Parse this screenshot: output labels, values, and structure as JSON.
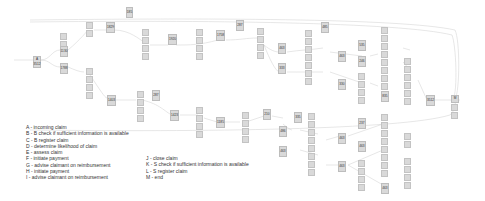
{
  "diagram": {
    "type": "process-graph",
    "start_node": {
      "label": "A",
      "count": "3512"
    },
    "end_node": {
      "label": "M",
      "count": "3512"
    },
    "nodes": [
      {
        "id": "n1",
        "label": "?",
        "count": "1130",
        "x": 60,
        "y": 44
      },
      {
        "id": "n2",
        "label": "?",
        "count": "1788",
        "x": 60,
        "y": 63
      },
      {
        "id": "n3",
        "label": "?",
        "count": "1829",
        "x": 106,
        "y": 26
      },
      {
        "id": "n4",
        "label": "?",
        "count": "185",
        "x": 126,
        "y": 10
      },
      {
        "id": "n5",
        "label": "?",
        "count": "1920",
        "x": 168,
        "y": 38
      },
      {
        "id": "n6",
        "label": "?",
        "count": "1758",
        "x": 218,
        "y": 33
      },
      {
        "id": "n7",
        "label": "?",
        "count": "287",
        "x": 238,
        "y": 20
      },
      {
        "id": "n8",
        "label": "?",
        "count": "463",
        "x": 279,
        "y": 47
      },
      {
        "id": "n9",
        "label": "?",
        "count": "333",
        "x": 279,
        "y": 68
      },
      {
        "id": "n10",
        "label": "?",
        "count": "485",
        "x": 323,
        "y": 22
      },
      {
        "id": "n11",
        "label": "?",
        "count": "463",
        "x": 362,
        "y": 53
      },
      {
        "id": "n12",
        "label": "?",
        "count": "330",
        "x": 362,
        "y": 80
      },
      {
        "id": "n13",
        "label": "?",
        "count": "535",
        "x": 395,
        "y": 44
      },
      {
        "id": "n14",
        "label": "?",
        "count": "246",
        "x": 395,
        "y": 59
      },
      {
        "id": "n15",
        "label": "?",
        "count": "835",
        "x": 418,
        "y": 93
      },
      {
        "id": "n16",
        "label": "?",
        "count": "3512",
        "x": 427,
        "y": 96
      },
      {
        "id": "n17",
        "label": "?",
        "count": "1403",
        "x": 107,
        "y": 96
      },
      {
        "id": "n18",
        "label": "?",
        "count": "287",
        "x": 154,
        "y": 92
      },
      {
        "id": "n19",
        "label": "?",
        "count": "1423",
        "x": 172,
        "y": 112
      },
      {
        "id": "n20",
        "label": "?",
        "count": "1185",
        "x": 217,
        "y": 119
      },
      {
        "id": "n21",
        "label": "?",
        "count": "210",
        "x": 264,
        "y": 112
      },
      {
        "id": "n22",
        "label": "?",
        "count": "486",
        "x": 292,
        "y": 127
      },
      {
        "id": "n23",
        "label": "?",
        "count": "335",
        "x": 303,
        "y": 112
      },
      {
        "id": "n24",
        "label": "?",
        "count": "463",
        "x": 278,
        "y": 150
      },
      {
        "id": "n25",
        "label": "?",
        "count": "463",
        "x": 340,
        "y": 133
      },
      {
        "id": "n26",
        "label": "?",
        "count": "463",
        "x": 340,
        "y": 162
      },
      {
        "id": "n27",
        "label": "?",
        "count": "237",
        "x": 383,
        "y": 120
      },
      {
        "id": "n28",
        "label": "?",
        "count": "463",
        "x": 383,
        "y": 145
      },
      {
        "id": "n29",
        "label": "?",
        "count": "463",
        "x": 383,
        "y": 181
      }
    ]
  },
  "legend": {
    "left": [
      "A - incoming claim",
      "B - B check if sufficient information is available",
      "C - B register claim",
      "D - determine likelihood of claim",
      "E - assess claim",
      "F - initiate payment",
      "G - advise claimant on reimbursement",
      "H - initiate payment",
      "I - advise claimant on reimbursement"
    ],
    "right": [
      "J - close claim",
      "K - S check if sufficient information is available",
      "L - S register claim",
      "M - end"
    ]
  }
}
